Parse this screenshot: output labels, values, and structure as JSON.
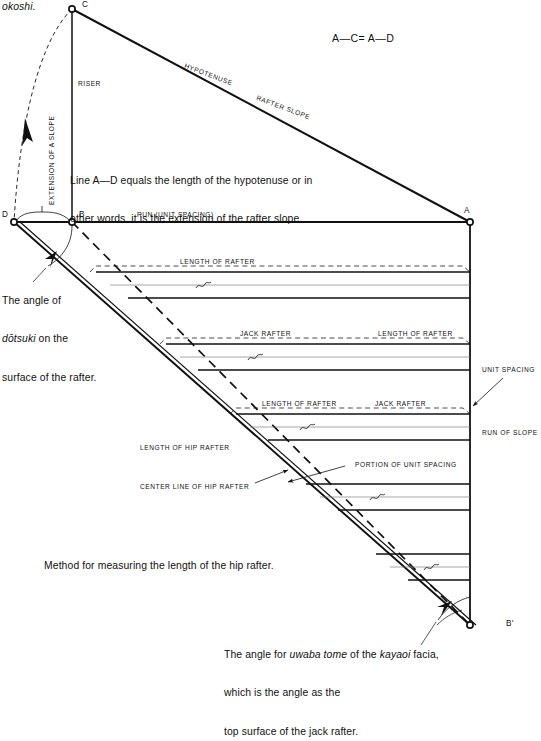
{
  "page": {
    "running_head": "okoshi.",
    "width": 541,
    "height": 664,
    "ink_color": "#111111",
    "paper_color": "#ffffff"
  },
  "formula": {
    "text": "A—C= A—D"
  },
  "vertices": {
    "c": "C",
    "b": "B",
    "d": "D",
    "a": "A",
    "b_prime": "B'"
  },
  "labels": {
    "riser": "RISER",
    "hypotenuse": "HYPOTENUSE",
    "rafter_slope": "RAFTER SLOPE",
    "extension_of_a_slope": "EXTENSION OF A SLOPE",
    "run_unit_spacing": "RUN (UNIT SPACING)",
    "unit_spacing": "UNIT SPACING",
    "run_of_slope": "RUN OF SLOPE",
    "length_of_rafter": "LENGTH OF RAFTER",
    "jack_rafter": "JACK RAFTER",
    "length_of_hip_rafter": "LENGTH OF HIP RAFTER",
    "center_line_of_hip_rafter": "CENTER LINE OF HIP RAFTER",
    "portion_of_unit_spacing": "PORTION OF UNIT SPACING"
  },
  "notes": {
    "line_ad": {
      "line1": "Line A—D equals the length of the hypotenuse or in",
      "line2": "other words. it is the extension of the rafter slope."
    },
    "dotsuki": {
      "line1": "The angle of",
      "line2_italic": "dōtsuki",
      "line2_rest": " on the",
      "line3": "surface of the rafter."
    },
    "method": "Method for measuring the length of the hip rafter.",
    "uwaba": {
      "line1_a": "The angle for ",
      "line1_italic1": "uwaba tome",
      "line1_b": " of the ",
      "line1_italic2": "kayaoi",
      "line1_c": " facia,",
      "line2": "which is the angle as the",
      "line3": "top surface of the jack rafter."
    }
  },
  "geometry": {
    "point_c": [
      72,
      9
    ],
    "point_b": [
      72,
      222
    ],
    "point_d": [
      14,
      222
    ],
    "point_a": [
      470,
      222
    ],
    "point_b_prime": [
      470,
      625
    ],
    "rafter_groups": [
      {
        "top_y": 272,
        "bottom_y": 298,
        "left_x": 96,
        "labels": [
          "LENGTH OF RAFTER"
        ]
      },
      {
        "top_y": 344,
        "bottom_y": 370,
        "left_x": 166,
        "labels": [
          "JACK RAFTER",
          "LENGTH OF RAFTER"
        ]
      },
      {
        "top_y": 414,
        "bottom_y": 440,
        "left_x": 236,
        "labels": [
          "LENGTH OF RAFTER",
          "JACK RAFTER"
        ]
      },
      {
        "top_y": 484,
        "bottom_y": 510,
        "left_x": 306,
        "labels": []
      },
      {
        "top_y": 554,
        "bottom_y": 580,
        "left_x": 376,
        "labels": []
      }
    ]
  }
}
